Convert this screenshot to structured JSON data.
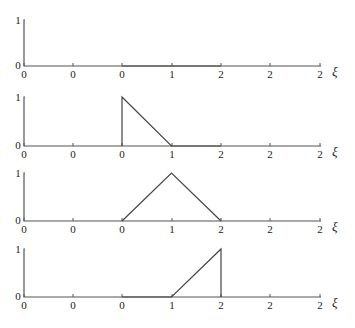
{
  "chart_data": [
    {
      "type": "line",
      "title": "",
      "xlabel": "ξ",
      "ylabel": "",
      "x_tick_labels": [
        "0",
        "0",
        "0",
        "1",
        "2",
        "2",
        "2"
      ],
      "y_tick_labels": [
        "0",
        "1"
      ],
      "ylim": [
        0,
        1
      ],
      "grid": false,
      "series": [
        {
          "name": "panel-1",
          "x": [
            0,
            2
          ],
          "y": [
            0,
            0
          ]
        }
      ]
    },
    {
      "type": "line",
      "title": "",
      "xlabel": "ξ",
      "ylabel": "",
      "x_tick_labels": [
        "0",
        "0",
        "0",
        "1",
        "2",
        "2",
        "2"
      ],
      "y_tick_labels": [
        "0",
        "1"
      ],
      "ylim": [
        0,
        1
      ],
      "grid": false,
      "series": [
        {
          "name": "panel-2",
          "x": [
            0,
            0,
            1,
            2
          ],
          "y": [
            0,
            1,
            0,
            0
          ]
        }
      ]
    },
    {
      "type": "line",
      "title": "",
      "xlabel": "ξ",
      "ylabel": "",
      "x_tick_labels": [
        "0",
        "0",
        "0",
        "1",
        "2",
        "2",
        "2"
      ],
      "y_tick_labels": [
        "0",
        "1"
      ],
      "ylim": [
        0,
        1
      ],
      "grid": false,
      "series": [
        {
          "name": "panel-3",
          "x": [
            0,
            1,
            2
          ],
          "y": [
            0,
            1,
            0
          ]
        }
      ]
    },
    {
      "type": "line",
      "title": "",
      "xlabel": "ξ",
      "ylabel": "",
      "x_tick_labels": [
        "0",
        "0",
        "0",
        "1",
        "2",
        "2",
        "2"
      ],
      "y_tick_labels": [
        "0",
        "1"
      ],
      "ylim": [
        0,
        1
      ],
      "grid": false,
      "series": [
        {
          "name": "panel-4",
          "x": [
            0,
            1,
            2,
            2
          ],
          "y": [
            0,
            0,
            1,
            0
          ]
        }
      ]
    }
  ],
  "panels": [
    {
      "ytick_top": "1",
      "ytick_bottom": "0",
      "xlabel": "ξ",
      "xticks": [
        "0",
        "0",
        "0",
        "1",
        "2",
        "2",
        "2"
      ]
    },
    {
      "ytick_top": "1",
      "ytick_bottom": "0",
      "xlabel": "ξ",
      "xticks": [
        "0",
        "0",
        "0",
        "1",
        "2",
        "2",
        "2"
      ]
    },
    {
      "ytick_top": "1",
      "ytick_bottom": "0",
      "xlabel": "ξ",
      "xticks": [
        "0",
        "0",
        "0",
        "1",
        "2",
        "2",
        "2"
      ]
    },
    {
      "ytick_top": "1",
      "ytick_bottom": "0",
      "xlabel": "ξ",
      "xticks": [
        "0",
        "0",
        "0",
        "1",
        "2",
        "2",
        "2"
      ]
    }
  ]
}
